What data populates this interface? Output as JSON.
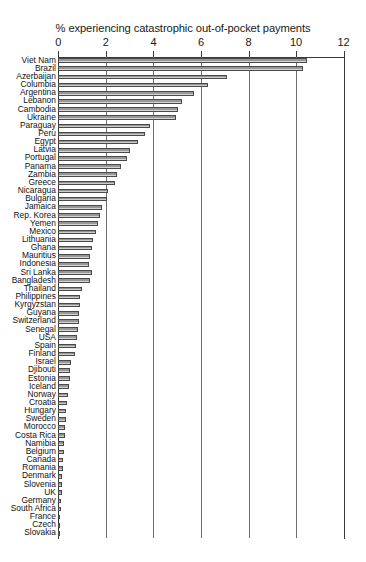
{
  "chart_data": {
    "type": "bar",
    "orientation": "horizontal",
    "title": "% experiencing catastrophic out-of-pocket payments",
    "xlabel": "",
    "ylabel": "",
    "xlim": [
      0,
      12
    ],
    "xticks": [
      0,
      2,
      4,
      6,
      8,
      10,
      12
    ],
    "xtick_labels": [
      "0",
      "2",
      "4",
      "6",
      "8",
      "10",
      "12"
    ],
    "grid": true,
    "legend": false,
    "categories": [
      "Viet Nam",
      "Brazil",
      "Azerbaijan",
      "Columbia",
      "Argentina",
      "Lebanon",
      "Cambodia",
      "Ukraine",
      "Paraguay",
      "Peru",
      "Egypt",
      "Latvia",
      "Portugal",
      "Panama",
      "Zambia",
      "Greece",
      "Nicaragua",
      "Bulgaria",
      "Jamaica",
      "Rep. Korea",
      "Yemen",
      "Mexico",
      "Lithuania",
      "Ghana",
      "Mauritius",
      "Indonesia",
      "Sri Lanka",
      "Bangladesh",
      "Thailand",
      "Philippines",
      "Kyrgyzstan",
      "Guyana",
      "Switzerland",
      "Senegal",
      "USA",
      "Spain",
      "Finland",
      "Israel",
      "Djibouti",
      "Estonia",
      "Iceland",
      "Norway",
      "Croatia",
      "Hungary",
      "Sweden",
      "Morocco",
      "Costa Rica",
      "Namibia",
      "Belgium",
      "Canada",
      "Romania",
      "Denmark",
      "Slovenia",
      "UK",
      "Germany",
      "South Africa",
      "France",
      "Czech",
      "Slovakia"
    ],
    "values": [
      10.45,
      10.3,
      7.1,
      6.3,
      5.7,
      5.2,
      5.05,
      4.95,
      3.85,
      3.65,
      3.35,
      3.0,
      2.9,
      2.65,
      2.45,
      2.4,
      2.1,
      2.05,
      1.85,
      1.75,
      1.65,
      1.6,
      1.45,
      1.4,
      1.35,
      1.3,
      1.4,
      1.35,
      1.0,
      0.93,
      0.9,
      0.87,
      0.85,
      0.83,
      0.8,
      0.72,
      0.7,
      0.55,
      0.5,
      0.47,
      0.43,
      0.4,
      0.35,
      0.32,
      0.3,
      0.28,
      0.26,
      0.24,
      0.22,
      0.2,
      0.18,
      0.17,
      0.16,
      0.15,
      0.12,
      0.1,
      0.08,
      0.06,
      0.05
    ]
  },
  "colors": {
    "bar_fill": "#9a9a9a",
    "bar_edge": "#4a4a4a",
    "axis": "#3a3a3a",
    "grid": "#6e6e6e",
    "text": "#1a1a1a",
    "background": "#ffffff"
  }
}
